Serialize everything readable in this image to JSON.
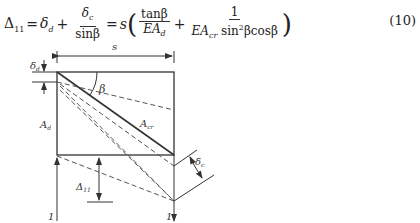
{
  "equation": {
    "lhs": "Δ",
    "lhs_sub": "11",
    "eq1": "=",
    "delta": "δ",
    "delta_sub": "d",
    "plus": "+",
    "frac1_num": "δ",
    "frac1_num_sub": "c",
    "frac1_den": "sinβ",
    "eq2": "=",
    "s": "s",
    "lparen": "(",
    "frac2_num": "tanβ",
    "frac2_den": "EA",
    "frac2_den_sub": "d",
    "plus2": "+",
    "frac3_num": "1",
    "frac3_den_a": "EA",
    "frac3_den_sub": "cr",
    "frac3_den_b": " sin",
    "frac3_den_sup": "2",
    "frac3_den_c": "βcosβ",
    "rparen": ")",
    "number": "(10)"
  },
  "figure": {
    "label_s": "s",
    "label_beta": "β",
    "label_delta_d": "δ",
    "label_delta_d_sub": "d",
    "label_Ad": "A",
    "label_Ad_sub": "d",
    "label_Acr": "A",
    "label_Acr_sub": "cr",
    "label_delta_c": "δ",
    "label_delta_c_sub": "c",
    "label_Delta11": "Δ",
    "label_Delta11_sub": "11",
    "load_left": "1",
    "load_right": "1"
  }
}
